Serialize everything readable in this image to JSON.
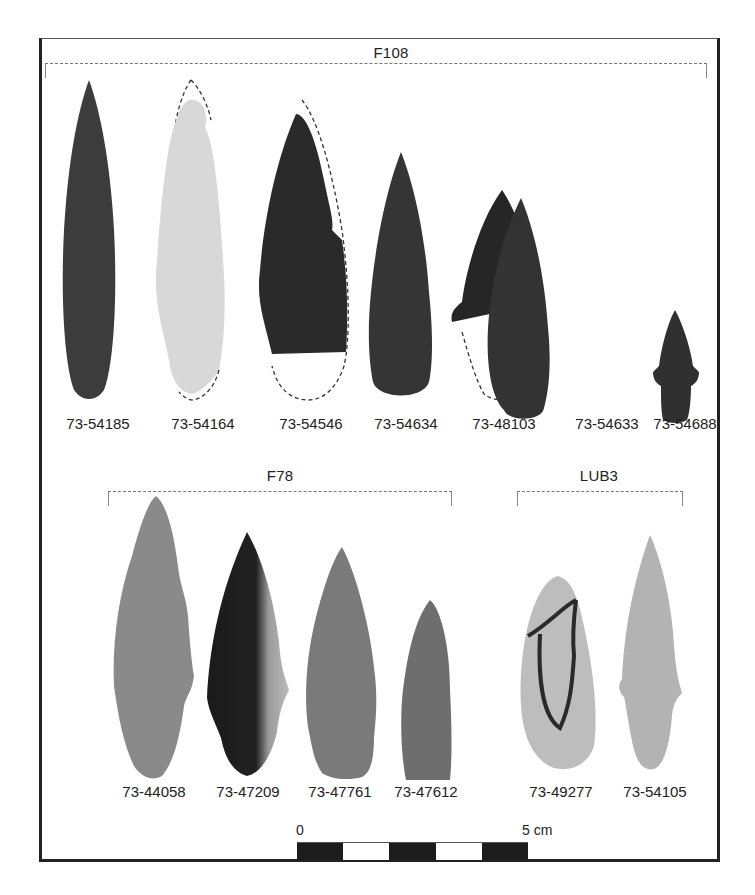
{
  "figure": {
    "groups": [
      {
        "id": "F108",
        "label": "F108",
        "specimens": [
          {
            "catalog": "73-54185",
            "tone": "#3c3c3c",
            "condition": "complete"
          },
          {
            "catalog": "73-54164",
            "tone": "#d8d8d8",
            "condition": "tip and base reconstructed (dashed)"
          },
          {
            "catalog": "73-54546",
            "tone": "#2a2a2a",
            "condition": "base and edge reconstructed (dashed)"
          },
          {
            "catalog": "73-54634",
            "tone": "#353535",
            "condition": "complete"
          },
          {
            "catalog": "73-48103",
            "tone": "#262626",
            "condition": "base reconstructed (dashed)"
          },
          {
            "catalog": "73-54633",
            "tone": "#333333",
            "condition": "complete"
          },
          {
            "catalog": "73-54688",
            "tone": "#303030",
            "condition": "complete"
          }
        ]
      },
      {
        "id": "F78",
        "label": "F78",
        "specimens": [
          {
            "catalog": "73-44058",
            "tone": "#8a8a8a",
            "condition": "complete"
          },
          {
            "catalog": "73-47209",
            "tone": "#1e1e1e",
            "condition": "complete, mottled"
          },
          {
            "catalog": "73-47761",
            "tone": "#7a7a7a",
            "condition": "complete"
          },
          {
            "catalog": "73-47612",
            "tone": "#6e6e6e",
            "condition": "complete"
          }
        ]
      },
      {
        "id": "LUB3",
        "label": "LUB3",
        "specimens": [
          {
            "catalog": "73-49277",
            "tone": "#bdbdbd",
            "condition": "complete, banded"
          },
          {
            "catalog": "73-54105",
            "tone": "#b3b3b3",
            "condition": "complete"
          }
        ]
      }
    ],
    "scale_bar": {
      "start_label": "0",
      "end_label": "5 cm",
      "segments": [
        "dark",
        "light",
        "dark",
        "light",
        "dark"
      ]
    }
  }
}
